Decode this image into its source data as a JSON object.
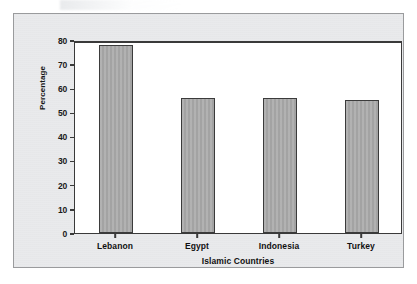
{
  "chart_data": {
    "type": "bar",
    "title": "",
    "categories": [
      "Lebanon",
      "Egypt",
      "Indonesia",
      "Turkey"
    ],
    "values": [
      78,
      56,
      56,
      55
    ],
    "xlabel": "Islamic Countries",
    "ylabel": "Percentage",
    "ylim": [
      0,
      80
    ],
    "yticks": [
      0,
      10,
      20,
      30,
      40,
      50,
      60,
      70,
      80
    ],
    "ytick_labels": [
      "0",
      "10",
      "20",
      "30",
      "40",
      "50",
      "60",
      "70",
      "80"
    ],
    "grid": false,
    "legend": null,
    "series": [
      {
        "name": "Percentage",
        "values": [
          78,
          56,
          56,
          55
        ]
      }
    ],
    "bar_color": "#a9a9a9",
    "bar_edge_color": "#3b3b3b",
    "plot_background": "#ffffff",
    "panel_background": "#e9eaec",
    "axis_color": "#3a3a3a"
  }
}
